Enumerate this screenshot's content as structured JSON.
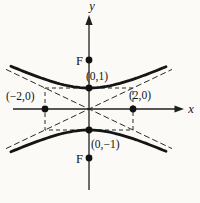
{
  "figure": {
    "background": "#fbfaf7",
    "ink": "#1f1f1f",
    "labels": {
      "y_axis": "y",
      "x_axis": "x",
      "focus_top": "F",
      "focus_bottom": "F",
      "vertex_top": "(0,1)",
      "vertex_bottom": "(0,−1)",
      "point_left": "(−2,0)",
      "point_right": "(2,0)"
    }
  },
  "chart_data": {
    "type": "diagram",
    "labeled_points": {
      "vertex_top": [
        0,
        1
      ],
      "vertex_bottom": [
        0,
        -1
      ],
      "point_left": [
        -2,
        0
      ],
      "point_right": [
        2,
        0
      ]
    },
    "foci_marker_label": "F",
    "foci_on_axis": "y",
    "central_rectangle": {
      "x_range": [
        -2,
        2
      ],
      "y_range": [
        -1,
        1
      ]
    },
    "asymptote_slopes": [
      0.5,
      -0.5
    ],
    "semi_axes": {
      "a_transverse_y": 1,
      "b_conjugate_x": 2
    },
    "axes": {
      "x_label": "x",
      "y_label": "y",
      "grid": false
    }
  }
}
